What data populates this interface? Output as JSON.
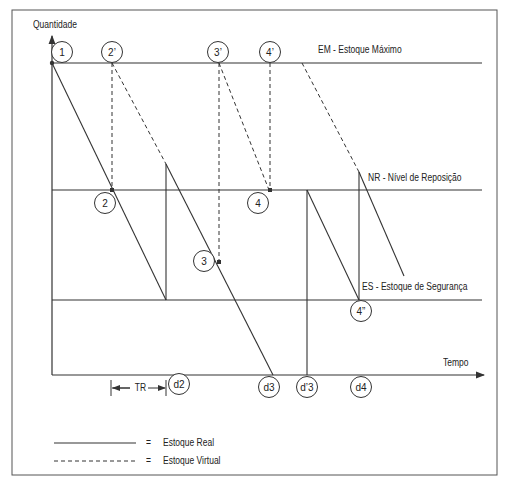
{
  "diagram": {
    "y_axis_label": "Quantidade",
    "x_axis_label": "Tempo",
    "levels": {
      "em": "EM - Estoque Máximo",
      "nr": "NR - Nível de Reposição",
      "es": "ES - Estoque de Segurança"
    },
    "points": {
      "p1": "1",
      "p2p": "2’",
      "p3p": "3’",
      "p4p": "4’",
      "p2": "2",
      "p3": "3",
      "p4": "4",
      "p4pp": "4”"
    },
    "dates": {
      "d2": "d2",
      "d3": "d3",
      "dp3": "d’3",
      "d4": "d4"
    },
    "tr_label": "TR",
    "legend": [
      {
        "style": "solid",
        "equals": "=",
        "label": "Estoque Real"
      },
      {
        "style": "dashed",
        "equals": "=",
        "label": "Estoque Virtual"
      }
    ],
    "colors": {
      "line": "#333333",
      "background": "#ffffff"
    }
  }
}
